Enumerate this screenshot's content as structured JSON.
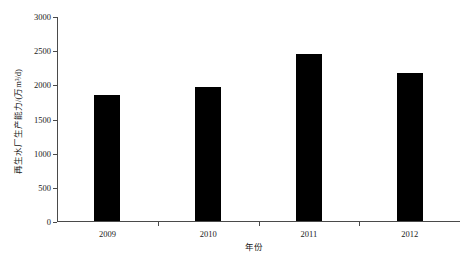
{
  "chart_data": {
    "type": "bar",
    "title": "",
    "subtitle": "",
    "categories": [
      "2009",
      "2010",
      "2011",
      "2012"
    ],
    "values": [
      1850,
      1960,
      2440,
      2170
    ],
    "series": [
      {
        "name": "再生水厂生产能力",
        "values": [
          1850,
          1960,
          2440,
          2170
        ]
      }
    ],
    "xlabel": "年份",
    "ylabel": "再生水厂生产能力/(万m³/d)",
    "ylim": [
      0,
      3000
    ],
    "yticks": [
      0,
      500,
      1000,
      1500,
      2000,
      2500,
      3000
    ],
    "ytick_labels": [
      "0",
      "500",
      "1000",
      "1500",
      "2000",
      "2500",
      "3000"
    ],
    "xtick_labels": [
      "2009",
      "2010",
      "2011",
      "2012"
    ],
    "grid": false,
    "legend": false,
    "legend_position": "none",
    "bar_color": "#000000",
    "axis_color": "#4a4a4a",
    "background_color": "#ffffff"
  },
  "axes": {
    "y_title": "再生水厂生产能力/(万m³/d)",
    "x_title": "年份"
  }
}
